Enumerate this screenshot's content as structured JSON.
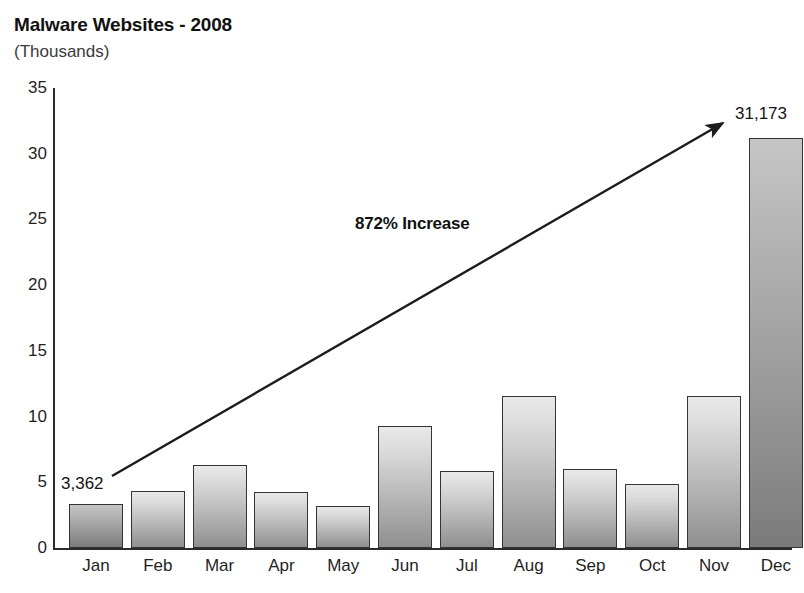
{
  "chart_data": {
    "type": "bar",
    "title": "Malware Websites - 2008",
    "subtitle": "(Thousands)",
    "xlabel": "",
    "ylabel": "(Thousands)",
    "ylim": [
      0,
      35
    ],
    "yticks": [
      0,
      5,
      10,
      15,
      20,
      25,
      30,
      35
    ],
    "grid": false,
    "legend": "none",
    "categories": [
      "Jan",
      "Feb",
      "Mar",
      "Apr",
      "May",
      "Jun",
      "Jul",
      "Aug",
      "Sep",
      "Oct",
      "Nov",
      "Dec"
    ],
    "values": [
      3.362,
      4.3,
      6.35,
      4.25,
      3.2,
      9.3,
      5.85,
      11.55,
      6.0,
      4.85,
      11.55,
      31.173
    ],
    "value_labels": {
      "Jan": "3,362",
      "Dec": "31,173"
    },
    "annotations": [
      {
        "text": "872% Increase",
        "type": "arrow-label",
        "arrow_from": "Jan",
        "arrow_to": "Dec"
      }
    ],
    "colors": {
      "bar_fill_light": "#dcdcdc",
      "bar_fill_dark": "#9a9a9a",
      "bar_border": "#343434",
      "axis": "#2b2b2b",
      "text": "#1a1a1a"
    }
  },
  "yticks_text": [
    "35",
    "30",
    "25",
    "20",
    "15",
    "10",
    "5",
    "0"
  ],
  "xticks_text": [
    "Jan",
    "Feb",
    "Mar",
    "Apr",
    "May",
    "Jun",
    "Jul",
    "Aug",
    "Sep",
    "Oct",
    "Nov",
    "Dec"
  ],
  "labels": {
    "first_bar_value": "3,362",
    "last_bar_value": "31,173",
    "increase": "872% Increase"
  }
}
